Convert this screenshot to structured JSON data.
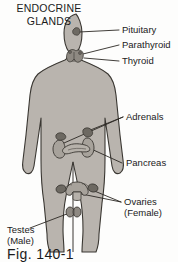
{
  "figure": {
    "title_line1": "ENDOCRINE",
    "title_line2": "GLANDS",
    "caption": "Fig. 140-1",
    "colors": {
      "background": "#fdfdfc",
      "body_fill": "#b9b4ae",
      "body_outline": "#3a3732",
      "gland_fill": "#8e8982",
      "gland_dark": "#6d6962",
      "organ_fill": "#a7a29b",
      "leader_line": "#2b2824",
      "text": "#1b1b1b"
    },
    "labels": [
      {
        "id": "pituitary",
        "text": "Pituitary"
      },
      {
        "id": "parathyroid",
        "text": "Parathyroid"
      },
      {
        "id": "thyroid",
        "text": "Thyroid"
      },
      {
        "id": "adrenals",
        "text": "Adrenals"
      },
      {
        "id": "pancreas",
        "text": "Pancreas"
      },
      {
        "id": "ovaries",
        "text": "Ovaries"
      },
      {
        "id": "ovaries_sub",
        "text": "(Female)"
      },
      {
        "id": "testes",
        "text": "Testes"
      },
      {
        "id": "testes_sub",
        "text": "(Male)"
      }
    ]
  }
}
